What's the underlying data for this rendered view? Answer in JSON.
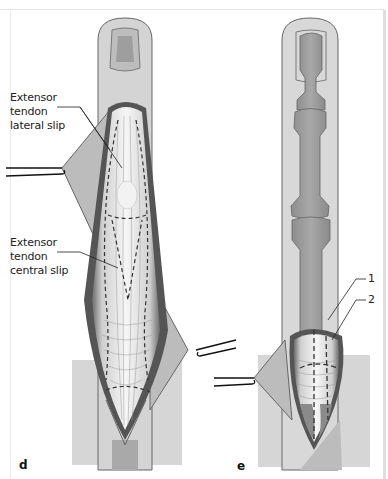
{
  "figure": {
    "panels": [
      {
        "id": "d",
        "letter": "d",
        "labels": [
          {
            "text": "Extensor\ntendon\nlateral slip"
          },
          {
            "text": "Extensor\ntendon\ncentral slip"
          }
        ]
      },
      {
        "id": "e",
        "letter": "e",
        "labels": [
          {
            "text": "1"
          },
          {
            "text": "2"
          }
        ]
      }
    ]
  },
  "colors": {
    "skin_light": "#d8d8d8",
    "skin_mid": "#c4c4c4",
    "bone": "#9c9c9c",
    "tendon": "#efefef",
    "outline": "#555555",
    "flap": "#b9b9b9"
  }
}
